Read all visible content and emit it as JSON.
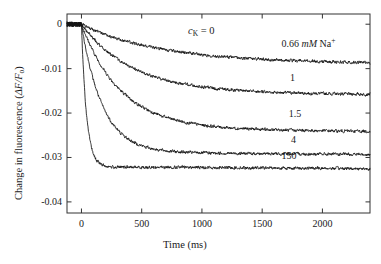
{
  "chart_data": {
    "type": "line",
    "title_parts": {
      "symbol": "c",
      "subscript": "K",
      "rest": " = 0"
    },
    "xlabel": "Time (ms)",
    "ylabel": "Change in fluorescence (ΔF/F₀)",
    "ylabel_parts": {
      "text": "Change in fluorescence (",
      "delta_f": "ΔF/F",
      "sub": "o",
      "close": ")"
    },
    "xlim": [
      -120,
      2395
    ],
    "ylim": [
      -0.0425,
      0.0023
    ],
    "xticks": [
      0,
      500,
      1000,
      1500,
      2000
    ],
    "xtick_labels": [
      "0",
      "500",
      "1000",
      "1500",
      "2000"
    ],
    "yticks": [
      0,
      -0.01,
      -0.02,
      -0.03,
      -0.04
    ],
    "ytick_labels": [
      "0",
      "-0.01",
      "-0.02",
      "-0.03",
      "-0.04"
    ],
    "grid": false,
    "legend_position": "inline-right-of-curves",
    "tick_direction": "in",
    "frame": "box",
    "line_color": "#141414",
    "series": [
      {
        "name": "0.66 mM Na+",
        "label": "0.66 mM Na⁺",
        "label_parts": {
          "value": "0.66 ",
          "unit": "mM",
          "ion": " Na",
          "charge": "+"
        },
        "concentration_mM": 0.66,
        "plateau": -0.0085,
        "tau_ms": 620,
        "label_x": 1660,
        "label_y": -0.0046
      },
      {
        "name": "1 mM Na+",
        "label": "1",
        "concentration_mM": 1,
        "plateau": -0.0155,
        "tau_ms": 420,
        "label_x": 1730,
        "label_y": -0.0123
      },
      {
        "name": "1.5 mM Na+",
        "label": "1.5",
        "concentration_mM": 1.5,
        "plateau": -0.0238,
        "tau_ms": 330,
        "label_x": 1720,
        "label_y": -0.0204
      },
      {
        "name": "4 mM Na+",
        "label": "4",
        "concentration_mM": 4,
        "plateau": -0.029,
        "tau_ms": 175,
        "label_x": 1740,
        "label_y": -0.0263
      },
      {
        "name": "150 mM Na+",
        "label": "150",
        "concentration_mM": 150,
        "plateau": -0.0322,
        "tau_ms": 42,
        "label_x": 1660,
        "label_y": -0.0299
      }
    ]
  }
}
